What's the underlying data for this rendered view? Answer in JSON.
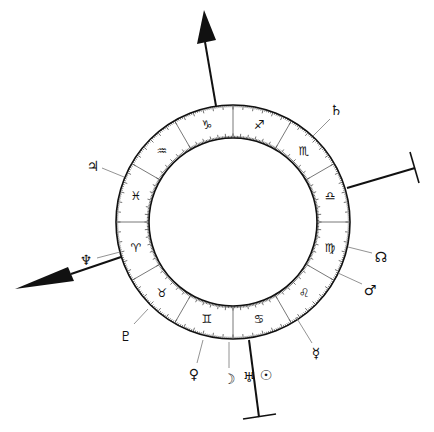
{
  "diagram": {
    "type": "astrological-chart-wheel",
    "colors": {
      "ink": "#111111",
      "ring_fill": "#ffffff",
      "leader_line": "#777777",
      "background": "#ffffff"
    },
    "zodiac_signs": [
      {
        "name": "libra",
        "glyph": "♎"
      },
      {
        "name": "scorpio",
        "glyph": "♏"
      },
      {
        "name": "sagittarius",
        "glyph": "♐"
      },
      {
        "name": "capricorn",
        "glyph": "♑"
      },
      {
        "name": "aquarius",
        "glyph": "♒"
      },
      {
        "name": "pisces",
        "glyph": "♓"
      },
      {
        "name": "aries",
        "glyph": "♈"
      },
      {
        "name": "taurus",
        "glyph": "♉"
      },
      {
        "name": "gemini",
        "glyph": "♊"
      },
      {
        "name": "cancer",
        "glyph": "♋"
      },
      {
        "name": "leo",
        "glyph": "♌"
      },
      {
        "name": "virgo",
        "glyph": "♍"
      }
    ],
    "planets": [
      {
        "name": "saturn",
        "glyph": "♄"
      },
      {
        "name": "jupiter",
        "glyph": "♃"
      },
      {
        "name": "neptune",
        "glyph": "♆"
      },
      {
        "name": "pluto",
        "glyph": "♇"
      },
      {
        "name": "venus",
        "glyph": "♀"
      },
      {
        "name": "moon",
        "glyph": "☽"
      },
      {
        "name": "uranus",
        "glyph": "♅"
      },
      {
        "name": "sun",
        "glyph": "☉"
      },
      {
        "name": "mercury",
        "glyph": "☿"
      },
      {
        "name": "mars",
        "glyph": "♂"
      },
      {
        "name": "north-node",
        "glyph": "☊"
      }
    ],
    "axes": [
      {
        "name": "midheaven-axis",
        "end_style": "arrow"
      },
      {
        "name": "ascendant-axis",
        "end_style": "arrow"
      },
      {
        "name": "descendant-axis",
        "end_style": "bar"
      },
      {
        "name": "imum-coeli-axis",
        "end_style": "bar"
      }
    ]
  }
}
